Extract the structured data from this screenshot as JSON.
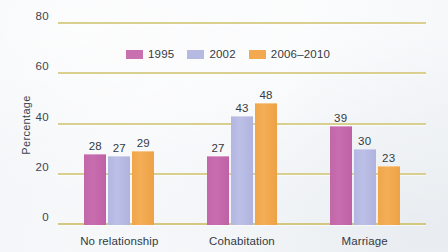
{
  "chart_data": {
    "type": "bar",
    "title": "",
    "subtitle": "",
    "xlabel": "",
    "ylabel": "Percentage",
    "categories": [
      "No relationship",
      "Cohabitation",
      "Marriage"
    ],
    "series": [
      {
        "name": "1995",
        "color": "#c970b0",
        "values": [
          28,
          27,
          39
        ]
      },
      {
        "name": "2002",
        "color": "#b6b9e2",
        "values": [
          27,
          43,
          30
        ]
      },
      {
        "name": "2006–2010",
        "color": "#f2a950",
        "values": [
          29,
          48,
          23
        ]
      }
    ],
    "ylim": [
      0,
      80
    ],
    "yticks": [
      0,
      20,
      40,
      60,
      80
    ],
    "ytick_labels": [
      "0",
      "20",
      "40",
      "60",
      "80"
    ],
    "grid": "horizontal",
    "grid_color": "#d9cf8e",
    "legend_position": "upper-center",
    "data_labels": true,
    "background_color": "#f5f7f9"
  }
}
